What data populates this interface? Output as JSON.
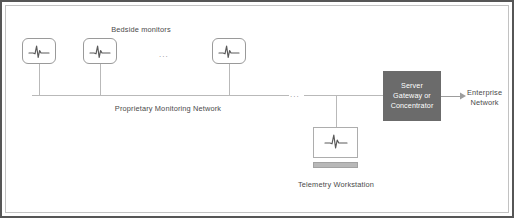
{
  "diagram": {
    "colors": {
      "frame_outer": "#565656",
      "frame_inner": "#c2c2c2",
      "line": "#b0b0b0",
      "node_stroke": "#9a9a9a",
      "server_fill": "#6b6b6b",
      "server_text": "#ffffff",
      "label_text": "#4a4a4a",
      "ecg_stroke": "#5a5a5a",
      "keyboard_fill": "#b8b8b8",
      "background": "#ffffff"
    },
    "labels": {
      "bedside_monitors": "Bedside monitors",
      "proprietary_network": "Proprietary Monitoring Network",
      "telemetry_workstation": "Telemetry Workstation",
      "ellipsis_monitors": "...",
      "ellipsis_bus": "..."
    },
    "server": {
      "line1": "Server",
      "line2": "Gateway or",
      "line3": "Concentrator"
    },
    "enterprise": {
      "line1": "Enterprise",
      "line2": "Network"
    },
    "nodes": {
      "monitor_1": {
        "name": "bedside-monitor-1",
        "icon": "ecg-waveform-icon"
      },
      "monitor_2": {
        "name": "bedside-monitor-2",
        "icon": "ecg-waveform-icon"
      },
      "monitor_3": {
        "name": "bedside-monitor-3",
        "icon": "ecg-waveform-icon"
      },
      "workstation": {
        "name": "telemetry-workstation",
        "icon": "ecg-waveform-icon"
      },
      "server_gateway": {
        "name": "server-gateway-concentrator"
      },
      "enterprise_network": {
        "name": "enterprise-network"
      }
    },
    "connections": [
      {
        "from": "bedside-monitor-1",
        "to": "proprietary-monitoring-network"
      },
      {
        "from": "bedside-monitor-2",
        "to": "proprietary-monitoring-network"
      },
      {
        "from": "bedside-monitor-3",
        "to": "proprietary-monitoring-network"
      },
      {
        "from": "telemetry-workstation",
        "to": "proprietary-monitoring-network"
      },
      {
        "from": "proprietary-monitoring-network",
        "to": "server-gateway-concentrator"
      },
      {
        "from": "server-gateway-concentrator",
        "to": "enterprise-network",
        "arrow": true
      }
    ]
  }
}
